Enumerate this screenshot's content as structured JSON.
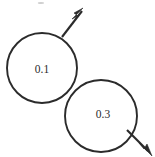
{
  "figure": {
    "background_color": "#ffffff",
    "stroke_color": "#2b2b2b",
    "width": 155,
    "height": 157,
    "circles": [
      {
        "id": "circle-a",
        "label": "0.1",
        "cx": 42,
        "cy": 68,
        "r": 35,
        "label_x": 42,
        "label_y": 69
      },
      {
        "id": "circle-b",
        "label": "0.3",
        "cx": 101,
        "cy": 116,
        "r": 36,
        "label_x": 103,
        "label_y": 114
      }
    ],
    "arrows": [
      {
        "id": "arrow-upper-right",
        "direction": "up-right",
        "x1": 62,
        "y1": 37,
        "x2": 82,
        "y2": 11,
        "head_points": "83,8 74,13 78,16 72,19"
      },
      {
        "id": "arrow-lower-right",
        "direction": "down-right",
        "x1": 127,
        "y1": 130,
        "x2": 148,
        "y2": 151,
        "head_points": "152,156 147,144 144,149 139,143"
      }
    ],
    "specks": [
      {
        "id": "speck-top",
        "cx": 41,
        "cy": 3,
        "rx": 3.2,
        "ry": 1.1
      }
    ]
  }
}
